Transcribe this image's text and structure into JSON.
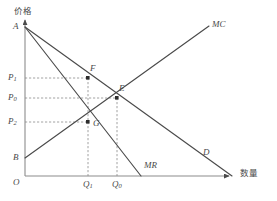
{
  "figure": {
    "background_color": "#ffffff",
    "line_color": "#4a4a4a",
    "dash_color": "#8c8c8c",
    "width": 277,
    "height": 201
  },
  "axes": {
    "y_axis_label": "价格",
    "x_axis_label": "数量",
    "origin_label": "O",
    "origin_px": {
      "x": 25,
      "y": 176
    },
    "y_top_px": 18,
    "x_right_px": 232
  },
  "y_ticks": [
    {
      "label": "P",
      "sub": "1",
      "y_px": 78
    },
    {
      "label": "P",
      "sub": "0",
      "y_px": 98
    },
    {
      "label": "P",
      "sub": "2",
      "y_px": 122
    }
  ],
  "x_ticks": [
    {
      "label": "Q",
      "sub": "1",
      "x_px": 88
    },
    {
      "label": "Q",
      "sub": "0",
      "x_px": 117
    }
  ],
  "points": [
    {
      "name": "A",
      "label": "A",
      "x_px": 25,
      "y_px": 27,
      "marked": false,
      "label_dx": -11,
      "label_dy": -5
    },
    {
      "name": "B",
      "label": "B",
      "x_px": 25,
      "y_px": 158,
      "marked": false,
      "label_dx": -11,
      "label_dy": -5
    },
    {
      "name": "F",
      "label": "F",
      "x_px": 88,
      "y_px": 78,
      "marked": true,
      "label_dx": 3,
      "label_dy": -13
    },
    {
      "name": "E",
      "label": "E",
      "x_px": 117,
      "y_px": 98,
      "marked": true,
      "label_dx": 2,
      "label_dy": -13
    },
    {
      "name": "G",
      "label": "G",
      "x_px": 88,
      "y_px": 122,
      "marked": true,
      "label_dx": 6,
      "label_dy": -3
    }
  ],
  "curves": [
    {
      "name": "demand",
      "label": "D",
      "from": {
        "x": 25,
        "y": 27
      },
      "to": {
        "x": 232,
        "y": 176
      },
      "label_x": 203,
      "label_y": 152
    },
    {
      "name": "marginal-revenue",
      "label": "MR",
      "from": {
        "x": 25,
        "y": 27
      },
      "to": {
        "x": 141,
        "y": 176
      },
      "label_x": 144,
      "label_y": 166
    },
    {
      "name": "marginal-cost",
      "label": "MC",
      "from": {
        "x": 25,
        "y": 158
      },
      "to": {
        "x": 209,
        "y": 26
      },
      "label_x": 212,
      "label_y": 24
    }
  ],
  "guide_lines": [
    {
      "name": "p1-to-f",
      "x1": 25,
      "y1": 78,
      "x2": 88,
      "y2": 78
    },
    {
      "name": "p0-to-e",
      "x1": 25,
      "y1": 98,
      "x2": 117,
      "y2": 98
    },
    {
      "name": "p2-to-g",
      "x1": 25,
      "y1": 122,
      "x2": 88,
      "y2": 122
    },
    {
      "name": "q1-vertical",
      "x1": 88,
      "y1": 78,
      "x2": 88,
      "y2": 176
    },
    {
      "name": "q0-vertical",
      "x1": 117,
      "y1": 98,
      "x2": 117,
      "y2": 176
    }
  ]
}
